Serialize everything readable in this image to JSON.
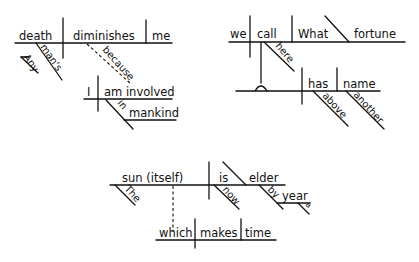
{
  "diagrams": [
    {
      "sentence_words": {
        "subject": "death",
        "verb": "diminishes",
        "object": "me",
        "mod_1": "man's",
        "mod_2": "Any",
        "conjunction": "because",
        "clause_subject": "I",
        "clause_verb": "am involved",
        "preposition": "in",
        "prep_object": "mankind"
      }
    },
    {
      "sentence_words": {
        "subject": "we",
        "verb": "call",
        "object": "What",
        "complement": "fortune",
        "adverb": "here",
        "verb_2": "has",
        "object_2": "name",
        "mod_1": "above",
        "mod_2": "another"
      }
    },
    {
      "sentence_words": {
        "subject": "sun (itself)",
        "article": "The",
        "verb": "is",
        "predicate": "elder",
        "adverb": "now",
        "preposition": "by",
        "prep_object": "year",
        "prep_article": "a",
        "rel_pronoun": "which",
        "rel_verb": "makes",
        "rel_object": "time"
      }
    }
  ],
  "colors": {
    "ink": "#111111",
    "background": "#ffffff"
  }
}
